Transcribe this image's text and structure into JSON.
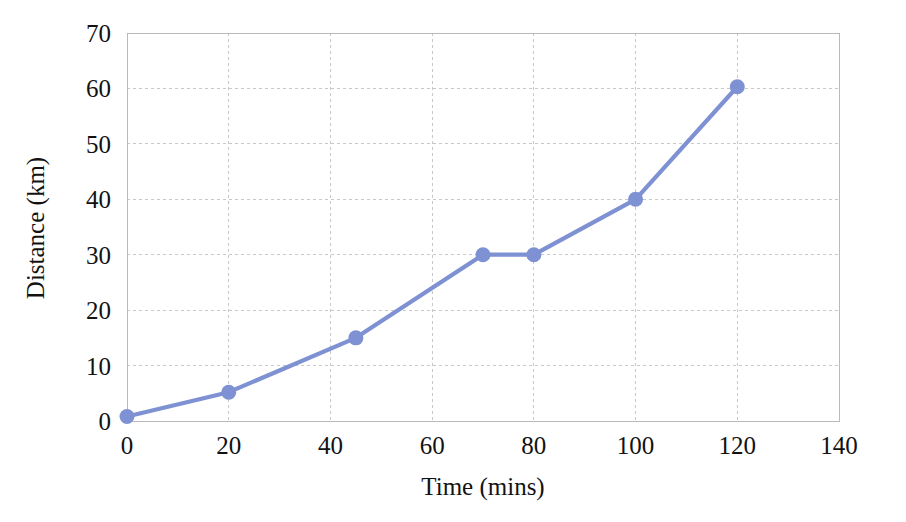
{
  "chart_data": {
    "type": "line",
    "title": "",
    "xlabel": "Time (mins)",
    "ylabel": "Distance (km)",
    "xlim": [
      0,
      140
    ],
    "ylim": [
      0,
      70
    ],
    "xticks": [
      0,
      20,
      40,
      60,
      80,
      100,
      120,
      140
    ],
    "yticks": [
      0,
      10,
      20,
      30,
      40,
      50,
      60,
      70
    ],
    "xtick_labels": [
      "0",
      "20",
      "40",
      "60",
      "80",
      "100",
      "120",
      "140"
    ],
    "ytick_labels": [
      "0",
      "10",
      "20",
      "30",
      "40",
      "50",
      "60",
      "70"
    ],
    "grid": true,
    "legend": false,
    "series": [
      {
        "name": "Distance travelled",
        "color": "#7e91d2",
        "marker": "circle",
        "x": [
          0,
          20,
          45,
          70,
          80,
          100,
          120
        ],
        "values": [
          0.8,
          5.2,
          15.0,
          30.0,
          30.0,
          40.0,
          60.3
        ]
      }
    ]
  },
  "style": {
    "line_color": "#7e91d2",
    "marker_color": "#7e91d2",
    "grid_color": "#c8c8c8",
    "frame_color": "#b9b9b9",
    "background": "#ffffff",
    "text_color": "#121212"
  }
}
